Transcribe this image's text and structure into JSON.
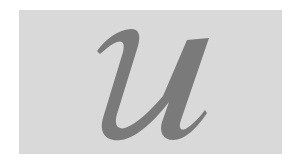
{
  "tile": {
    "letter": "u",
    "background_color": "#d9d9d9",
    "letter_color": "#7a7a7a",
    "style": "italic serif"
  }
}
